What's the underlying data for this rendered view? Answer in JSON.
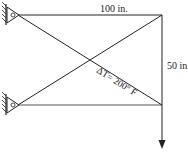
{
  "diagram": {
    "type": "truss",
    "labels": {
      "top_dimension": "100 in.",
      "right_dimension": "50 in",
      "temperature": "ΔT= 200° F"
    },
    "supports": [
      {
        "name": "top-left-pin",
        "type": "pin"
      },
      {
        "name": "bottom-left-pin",
        "type": "pin"
      }
    ],
    "members": [
      {
        "name": "top-horizontal"
      },
      {
        "name": "bottom-horizontal"
      },
      {
        "name": "diagonal-top-left-to-bottom-right"
      },
      {
        "name": "diagonal-bottom-left-to-top-right"
      },
      {
        "name": "right-vertical"
      }
    ],
    "load": {
      "direction": "down",
      "icon": "arrow-down-icon"
    },
    "colors": {
      "line": "#222222",
      "background": "#ffffff"
    }
  }
}
